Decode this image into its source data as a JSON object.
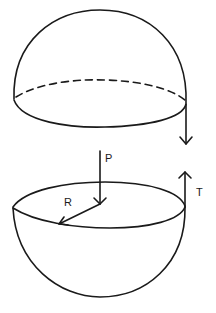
{
  "diagram": {
    "upper_hemisphere": {
      "label": "",
      "base_edge_hidden": "dashed"
    },
    "lower_hemisphere": {
      "label": ""
    },
    "labels": {
      "pressure": "P",
      "radius": "R",
      "tension": "T"
    },
    "colors": {
      "stroke": "#1a1a1a",
      "background": "#ffffff"
    }
  }
}
